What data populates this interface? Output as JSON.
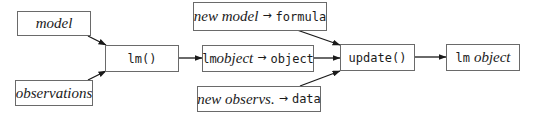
{
  "diagram": {
    "nodes": {
      "model": {
        "label": "model"
      },
      "observations": {
        "label": "observations"
      },
      "lm_call": {
        "label": "lm()"
      },
      "lm_object_in": {
        "code": "lm",
        "italic": "object",
        "arrow": "→",
        "target": "object"
      },
      "new_model": {
        "italic": "new model",
        "arrow": "→",
        "target": "formula"
      },
      "new_observs": {
        "italic": "new observs.",
        "arrow": "→",
        "target": "data"
      },
      "update_call": {
        "label": "update()"
      },
      "lm_object_out": {
        "code": "lm",
        "italic": "object"
      }
    },
    "edges": [
      {
        "from": "model",
        "to": "lm_call"
      },
      {
        "from": "observations",
        "to": "lm_call"
      },
      {
        "from": "lm_call",
        "to": "lm_object_in"
      },
      {
        "from": "new_model",
        "to": "update_call"
      },
      {
        "from": "lm_object_in",
        "to": "update_call"
      },
      {
        "from": "new_observs",
        "to": "update_call"
      },
      {
        "from": "update_call",
        "to": "lm_object_out"
      }
    ],
    "colors": {
      "border": "#6a6a6a",
      "arrow": "#1a1a1a",
      "text": "#1a1a1a",
      "background": "#ffffff"
    }
  }
}
